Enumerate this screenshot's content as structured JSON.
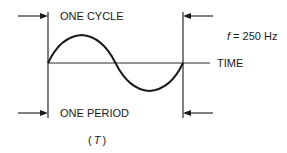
{
  "diagram": {
    "labels": {
      "one_cycle": "ONE CYCLE",
      "frequency_symbol": "f",
      "frequency_value": " = 250 Hz",
      "time_axis": "TIME",
      "one_period": "ONE PERIOD",
      "period_open": "(",
      "period_symbol": "T",
      "period_close": ")"
    },
    "waveform": {
      "type": "sine",
      "cycles": 1,
      "frequency_hz": 250
    },
    "colors": {
      "line": "#2a2a2a",
      "text": "#1a1a1a",
      "background": "#ffffff"
    }
  }
}
